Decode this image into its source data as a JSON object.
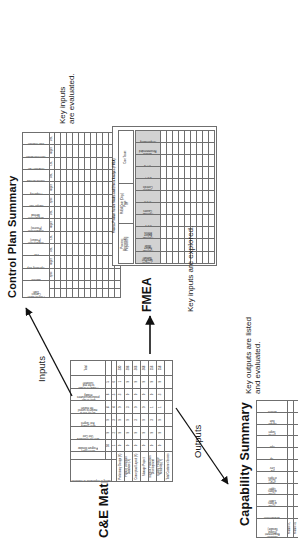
{
  "diagram": {
    "title_ce": "C&E Matrix",
    "title_controlplan": "Control Plan Summary",
    "title_fmea": "FMEA",
    "title_fmea_sub": "Process/Product Failure Modes and Effects Analysis (FMEA)",
    "title_capability": "Capability Summary",
    "arrow_inputs_label": "Inputs",
    "arrow_outputs_label": "Outputs",
    "caption_controlplan": "Key inputs\nare evaluated.",
    "caption_fmea": "Key inputs are explored.",
    "caption_capability": "Key outputs are listed\nand evaluated."
  },
  "ce_matrix": {
    "rating_header": "Rating of Importance to Customer",
    "steps_header": "Process Inputs (Steps)",
    "total_header": "Total",
    "total_row_label": "Total Customer Scores",
    "col_ratings": [
      "10",
      "9",
      "9",
      "8",
      "6",
      "5"
    ],
    "col_numbers": [
      "1",
      "2",
      "3",
      "4",
      "5",
      "6"
    ],
    "outputs": [
      "Meet Hours\nProgram Window",
      "Meet the Estimated\nUnit Cost",
      "Meet Quality\nExit Targets",
      "Be the first to\nmarket to control\nthe market",
      "Meet in rate\nproduction volumes\nreliably",
      "Product is flexible\nto the end\ncustomer"
    ],
    "inputs": [
      "Preliminary Design (X)",
      "Product Definition\nDatabase (X)",
      "Conceptual Layout (X)",
      "Manage Project",
      "Support Production\nDevelopment",
      "Quality Product/\nReliability (Y)"
    ],
    "scores": [
      [
        "9",
        "9",
        "9",
        "9",
        "3",
        "1"
      ],
      [
        "9",
        "9",
        "9",
        "3",
        "9",
        "9"
      ],
      [
        "9",
        "9",
        "3",
        "9",
        "9",
        "9"
      ],
      [
        "9",
        "9",
        "9",
        "9",
        "9",
        "9"
      ],
      [
        "9",
        "9",
        "3",
        "1",
        "9",
        "9"
      ],
      [
        "9",
        "9",
        "9",
        "1",
        "3",
        "9"
      ]
    ],
    "totals": [
      "330",
      "396",
      "366",
      "368",
      "256",
      "258"
    ]
  },
  "control_plan": {
    "meta_left": [
      "Process Name:",
      "Contact:",
      "Date:"
    ],
    "meta_mid": [
      "Part/\nProcess\nNumber",
      "Process\nName/\nOperation\nDescription"
    ],
    "group_measure": [
      "Frequency",
      "Sample Size",
      "Measurement Sys."
    ],
    "group_react": [
      "Reaction Plan",
      "Control Method",
      "Corrective Action"
    ],
    "columns": [
      "Machine",
      "Operating Step",
      "LSL",
      "Characteristic\n(Product)",
      "Characteristic\n(Process)",
      "Measurement\nMethod",
      "Sample Size",
      "Frequency",
      "Control Method",
      "Reaction Plan",
      "Corrective Action",
      "Staff Reaction"
    ],
    "subheads": [
      "Spec",
      "Target",
      "USL",
      "LSL",
      "Target",
      "USL"
    ],
    "rows": 11
  },
  "fmea": {
    "meta": [
      "Process:",
      "Responsible:",
      "Prepared by:",
      "FMEA Date (Orig.)",
      "Page",
      "of",
      "Core Team:"
    ],
    "columns": [
      "Process\nStep/Part\nNumber",
      "Potential\nFailure\nMode",
      "Potential\nFailure\nEffects",
      "S E V",
      "Potential\nCauses",
      "O C C",
      "Current\nControls",
      "D E T",
      "R P N",
      "Actions\nRecommended",
      "Responsibility"
    ],
    "rows": 9
  },
  "capability": {
    "columns": [
      "Customer\nRequirement\n(Output\nVariable)",
      "Measurement",
      "% Out\nof Spec\nLower",
      "% Out\nof Spec\nUpper",
      "Target\n% Out\nof Spec",
      "Std\nDev",
      "Cp",
      "Cpk",
      "On the\nTarget",
      "Sample\nSize",
      "Actions"
    ],
    "rows": [
      "Feature #1",
      "Feature #2",
      "Product",
      "Feature #3",
      "Feature #4",
      "Project",
      "Cost",
      "Development",
      "Production",
      "Reliability"
    ]
  },
  "style": {
    "line": "#6f6f6f",
    "shade": "#d2d2d2",
    "ink": "#111111"
  }
}
